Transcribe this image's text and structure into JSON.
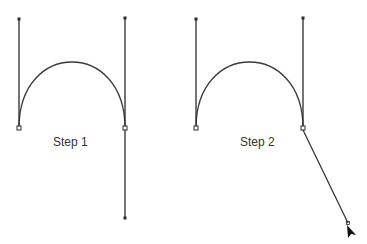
{
  "colors": {
    "stroke": "#2b2b2b",
    "curve": "#3a3a3a",
    "background": "#ffffff"
  },
  "steps": [
    {
      "label": "Step 1",
      "left_anchor": {
        "x": 19,
        "y": 128
      },
      "left_handle": {
        "x": 19,
        "y": 19
      },
      "right_anchor": {
        "x": 125,
        "y": 128
      },
      "right_handle_top": {
        "x": 125,
        "y": 18
      },
      "right_handle_bottom": {
        "x": 125,
        "y": 218
      },
      "curve_top_y": 47
    },
    {
      "label": "Step 2",
      "left_anchor": {
        "x": 196,
        "y": 128
      },
      "left_handle": {
        "x": 196,
        "y": 19
      },
      "right_anchor": {
        "x": 303,
        "y": 128
      },
      "right_handle_top": {
        "x": 303,
        "y": 18
      },
      "drag_line_end": {
        "x": 349,
        "y": 224
      },
      "cursor_icon": "arrow-cursor-icon"
    }
  ]
}
